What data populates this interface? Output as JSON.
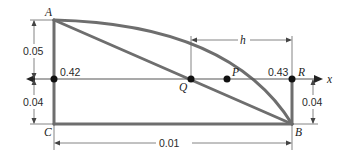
{
  "diagram": {
    "type": "geometry-figure",
    "colors": {
      "structure": "#6e6e6e",
      "thin": "#555555",
      "dot": "#111111",
      "text": "#2a2a2a"
    },
    "points": {
      "A": "A",
      "B": "B",
      "C": "C",
      "P": "P",
      "Q": "Q",
      "R": "R"
    },
    "axis": {
      "label": "x"
    },
    "values": {
      "left_point_value": "0.42",
      "right_point_value": "0.43"
    },
    "dimensions": {
      "left_upper": "0.05",
      "left_lower": "0.04",
      "right_lower": "0.04",
      "bottom_width": "0.01",
      "h": "h"
    }
  }
}
